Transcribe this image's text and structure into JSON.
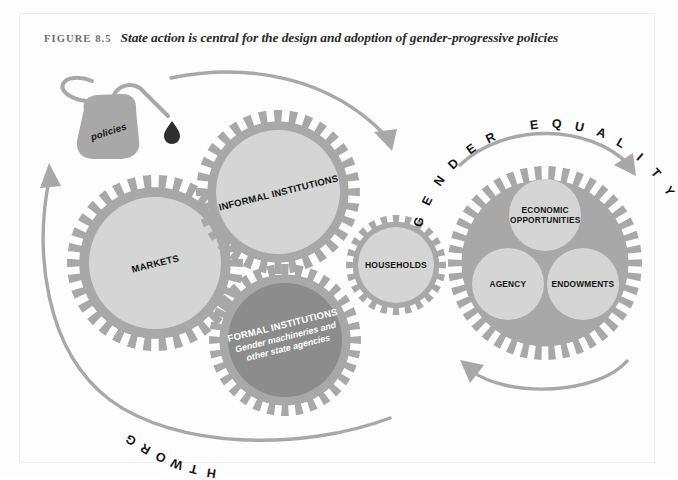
{
  "figure": {
    "label": "FIGURE 8.5",
    "title": "State action is central for the design and adoption of gender-progressive policies"
  },
  "colors": {
    "background": "#fdfdfd",
    "gear_teeth": "#a8a8a8",
    "gear_inner_light": "#d5d5d5",
    "gear_inner_dark": "#8c8c8c",
    "arrow": "#a8a8a8",
    "oilcan": "#a8a8a8",
    "drop": "#2f2f2f",
    "text_dark": "#141414",
    "text_white": "#ffffff",
    "title_label": "#6e6e6e",
    "title_text": "#2b2b2b",
    "frame_border": "#efefef"
  },
  "oil_can": {
    "label": "policies",
    "drop_name": "oil-drop"
  },
  "gears": [
    {
      "id": "markets",
      "label": "MARKETS",
      "cx": 155,
      "cy": 263,
      "r_outer": 88,
      "r_inner": 66,
      "teeth": 34,
      "fill": "light",
      "rotation": -14,
      "font_size": 9.5
    },
    {
      "id": "informal-institutions",
      "label": "INFORMAL INSTITUTIONS",
      "cx": 278,
      "cy": 192,
      "r_outer": 82,
      "r_inner": 62,
      "teeth": 32,
      "fill": "light",
      "rotation": -14,
      "font_size": 9.5
    },
    {
      "id": "formal-institutions",
      "label": "FORMAL INSTITUTIONS",
      "sublabel_line1": "Gender machineries and",
      "sublabel_line2": "other state agencies",
      "cx": 285,
      "cy": 340,
      "r_outer": 76,
      "r_inner": 57,
      "teeth": 32,
      "fill": "dark",
      "rotation": -14,
      "font_size": 9.5
    },
    {
      "id": "households",
      "label": "HOUSEHOLDS",
      "cx": 396,
      "cy": 265,
      "r_outer": 50,
      "r_inner": 38,
      "teeth": 24,
      "fill": "light",
      "rotation": 0,
      "font_size": 8.5
    },
    {
      "id": "gender-equality-gear",
      "label": "",
      "cx": 545,
      "cy": 263,
      "r_outer": 97,
      "r_inner": 0,
      "teeth": 42,
      "fill": "light",
      "rotation": 0,
      "font_size": 0
    }
  ],
  "outcome_circles": [
    {
      "id": "economic-opportunities",
      "line1": "ECONOMIC",
      "line2": "OPPORTUNITIES",
      "cx": 545,
      "cy": 215,
      "r": 36,
      "font_size": 8.3
    },
    {
      "id": "agency",
      "line1": "AGENCY",
      "line2": "",
      "cx": 508,
      "cy": 284,
      "r": 36,
      "font_size": 8.3
    },
    {
      "id": "endowments",
      "line1": "ENDOWMENTS",
      "line2": "",
      "cx": 583,
      "cy": 284,
      "r": 36,
      "font_size": 8.3
    }
  ],
  "annotations": {
    "gender_equality": "GENDER EQUALITY",
    "growth": "GROWTH"
  },
  "icon_names": {
    "oil_can": "oil-can-icon",
    "drop": "oil-drop-icon",
    "arrow_top": "curved-arrow-top-icon",
    "arrow_growth": "curved-arrow-growth-icon",
    "arrow_gender_equality": "curved-arrow-gender-equality-icon",
    "arrow_feedback": "curved-arrow-feedback-icon"
  }
}
